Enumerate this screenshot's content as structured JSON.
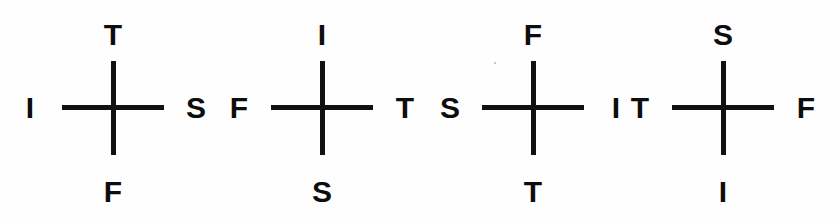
{
  "figure": {
    "background_color": "#ffffff",
    "ink_color": "#111111",
    "stroke_width_px": 5,
    "arm_length_px": 47,
    "crosses": [
      {
        "id": "cross-1",
        "center_x": 113,
        "center_y": 108,
        "top": "T",
        "left": "I",
        "right": "S",
        "bottom": "F"
      },
      {
        "id": "cross-2",
        "center_x": 322,
        "center_y": 108,
        "top": "I",
        "left": "F",
        "right": "T",
        "bottom": "S"
      },
      {
        "id": "cross-3",
        "center_x": 533,
        "center_y": 108,
        "top": "F",
        "left": "S",
        "right": "I",
        "bottom": "T"
      },
      {
        "id": "cross-4",
        "center_x": 723,
        "center_y": 108,
        "top": "S",
        "left": "T",
        "right": "F",
        "bottom": "I"
      }
    ]
  }
}
